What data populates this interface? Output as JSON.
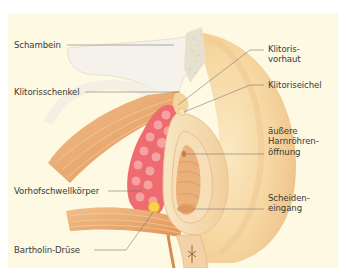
{
  "figure": {
    "type": "anatomical-illustration",
    "background_color": "#fdf9e3",
    "leader_line_color": "#6f6f6f"
  },
  "labels": {
    "left": [
      {
        "id": "schambein",
        "text": "Schambein"
      },
      {
        "id": "klitorisschenkel",
        "text": "Klitorisschenkel"
      },
      {
        "id": "vorhofschwellkoerper",
        "text": "Vorhofschwellkörper"
      },
      {
        "id": "bartholin",
        "text": "Bartholin-Drüse"
      }
    ],
    "right": [
      {
        "id": "klitorisvorhaut",
        "line1": "Klitoris-",
        "line2": "vorhaut"
      },
      {
        "id": "klitoriseichel",
        "text": "Klitoriseichel"
      },
      {
        "id": "harnroehre",
        "line1": "äußere",
        "line2": "Harnröhren-",
        "line3": "öffnung"
      },
      {
        "id": "scheideneingang",
        "line1": "Scheiden-",
        "line2": "eingang"
      }
    ]
  },
  "colors": {
    "bone": "#f4f2ea",
    "bone_spongy": "#e6e0cf",
    "skin_light": "#f6dfb0",
    "skin_mid": "#f0c98e",
    "skin_shade": "#e9b377",
    "muscle": "#e8a36a",
    "muscle_dark": "#c97a44",
    "erectile_tissue": "#ee6b6f",
    "erectile_highlight": "#f7a9a9",
    "gland": "#f7d24a",
    "mucosa": "#eab27a"
  }
}
